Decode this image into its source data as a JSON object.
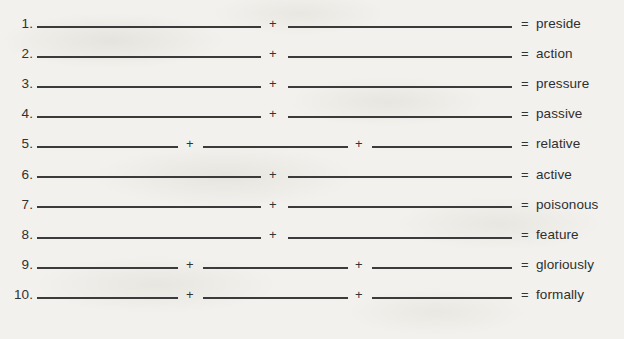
{
  "worksheet": {
    "background_color": "#f2f1ed",
    "ink_color": "#3b3b3b",
    "plus_symbol": "+",
    "equals_symbol": "=",
    "rows": [
      {
        "number": "1.",
        "blanks": 2,
        "answer": "preside"
      },
      {
        "number": "2.",
        "blanks": 2,
        "answer": "action"
      },
      {
        "number": "3.",
        "blanks": 2,
        "answer": "pressure"
      },
      {
        "number": "4.",
        "blanks": 2,
        "answer": "passive"
      },
      {
        "number": "5.",
        "blanks": 3,
        "answer": "relative"
      },
      {
        "number": "6.",
        "blanks": 2,
        "answer": "active"
      },
      {
        "number": "7.",
        "blanks": 2,
        "answer": "poisonous"
      },
      {
        "number": "8.",
        "blanks": 2,
        "answer": "feature"
      },
      {
        "number": "9.",
        "blanks": 3,
        "answer": "gloriously"
      },
      {
        "number": "10.",
        "blanks": 3,
        "answer": "formally"
      }
    ]
  }
}
